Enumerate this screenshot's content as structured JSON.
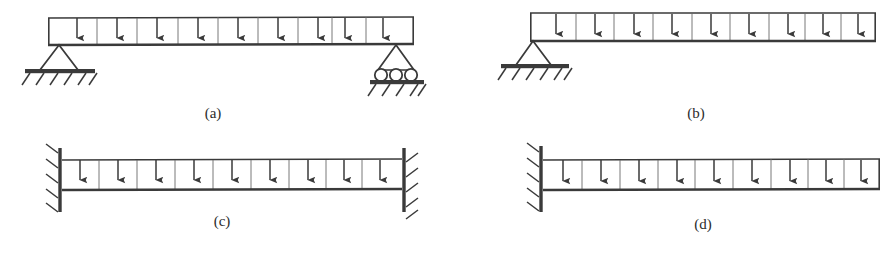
{
  "figure": {
    "background_color": "#ffffff",
    "ink_color": "#3a3a3a",
    "panel_count": 4
  },
  "panels": [
    {
      "id": "a",
      "caption": "(a)",
      "description": "Simply supported beam with pin support at left and roller support at right, uniformly distributed downward load",
      "load": {
        "type": "uniformly-distributed",
        "direction": "down",
        "arrow_count": 9
      },
      "supports": [
        {
          "side": "left",
          "type": "pin",
          "symbol": "triangle-on-hatched-ground"
        },
        {
          "side": "right",
          "type": "roller",
          "symbol": "triangle-on-three-rollers-hatched-ground",
          "roller_count": 3
        }
      ],
      "caption_x": 213,
      "caption_y": 118,
      "beam": {
        "x": 48,
        "y": 17,
        "width": 366,
        "height": 28
      }
    },
    {
      "id": "b",
      "caption": "(b)",
      "description": "Beam with a single pin support at the left end, free at the right end, uniformly distributed downward load",
      "load": {
        "type": "uniformly-distributed",
        "direction": "down",
        "arrow_count": 9
      },
      "supports": [
        {
          "side": "left",
          "type": "pin",
          "symbol": "triangle-on-hatched-ground"
        }
      ],
      "caption_x": 696,
      "caption_y": 118,
      "beam": {
        "x": 530,
        "y": 13,
        "width": 345,
        "height": 28
      }
    },
    {
      "id": "c",
      "caption": "(c)",
      "description": "Fixed-fixed beam built in at both ends, uniformly distributed downward load",
      "load": {
        "type": "uniformly-distributed",
        "direction": "down",
        "arrow_count": 9
      },
      "supports": [
        {
          "side": "left",
          "type": "fixed",
          "symbol": "hatched-wall"
        },
        {
          "side": "right",
          "type": "fixed",
          "symbol": "hatched-wall"
        }
      ],
      "caption_x": 222,
      "caption_y": 225,
      "beam": {
        "x": 62,
        "y": 160,
        "width": 340,
        "height": 30
      }
    },
    {
      "id": "d",
      "caption": "(d)",
      "description": "Cantilever beam fixed at the left end, free at the right end, uniformly distributed downward load",
      "load": {
        "type": "uniformly-distributed",
        "direction": "down",
        "arrow_count": 9
      },
      "supports": [
        {
          "side": "left",
          "type": "fixed",
          "symbol": "hatched-wall"
        }
      ],
      "caption_x": 703,
      "caption_y": 228,
      "beam": {
        "x": 543,
        "y": 160,
        "width": 337,
        "height": 30
      }
    }
  ]
}
